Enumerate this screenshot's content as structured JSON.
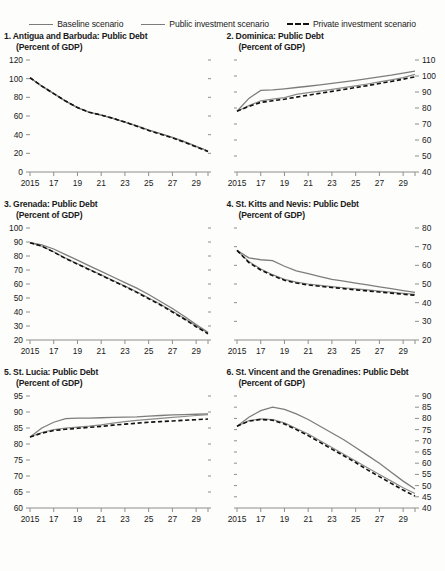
{
  "legend": {
    "items": [
      {
        "label": "Baseline scenario",
        "style": "solid",
        "color": "#7d7d7d"
      },
      {
        "label": "Public investment scenario",
        "style": "solid",
        "color": "#8a8a8a"
      },
      {
        "label": "Private investment scenario",
        "style": "dashed",
        "color": "#111111"
      }
    ]
  },
  "chart_data": [
    {
      "type": "line",
      "title": "1. Antigua and Barbuda: Public Debt",
      "subtitle": "(Percent of GDP)",
      "index": "1",
      "xlabel": "",
      "ylabel": "",
      "ylim": [
        0,
        120
      ],
      "yticks": [
        0,
        20,
        40,
        60,
        80,
        100,
        120
      ],
      "axis_side": "left",
      "x": [
        2015,
        2016,
        2017,
        2018,
        2019,
        2020,
        2021,
        2022,
        2023,
        2024,
        2025,
        2026,
        2027,
        2028,
        2029,
        2030
      ],
      "xticklabels": [
        "2015",
        "17",
        "19",
        "21",
        "23",
        "25",
        "27",
        "29"
      ],
      "series": [
        {
          "name": "Baseline scenario",
          "values": [
            101,
            92,
            84,
            76,
            69,
            64,
            61,
            57.5,
            53.5,
            49.5,
            45,
            41,
            37,
            32.5,
            27.5,
            22.5
          ]
        },
        {
          "name": "Public investment scenario",
          "values": [
            101,
            92,
            84,
            76,
            69,
            64,
            61,
            57.5,
            53.5,
            49.5,
            45,
            41,
            37,
            32.5,
            27.5,
            22.5
          ]
        },
        {
          "name": "Private investment scenario",
          "values": [
            101,
            92,
            84,
            76,
            69,
            64,
            61,
            57.5,
            53.5,
            49,
            44.5,
            40.5,
            36.5,
            32,
            27,
            22
          ]
        }
      ]
    },
    {
      "type": "line",
      "title": "2. Dominica: Public Debt",
      "subtitle": "(Percent of GDP)",
      "index": "2",
      "xlabel": "",
      "ylabel": "",
      "ylim": [
        40,
        110
      ],
      "yticks": [
        40,
        50,
        60,
        70,
        80,
        90,
        100,
        110
      ],
      "axis_side": "right",
      "x": [
        2015,
        2016,
        2017,
        2018,
        2019,
        2020,
        2021,
        2022,
        2023,
        2024,
        2025,
        2026,
        2027,
        2028,
        2029,
        2030
      ],
      "xticklabels": [
        "2015",
        "17",
        "19",
        "21",
        "23",
        "25",
        "27",
        "29"
      ],
      "series": [
        {
          "name": "Baseline scenario",
          "values": [
            78,
            86,
            91,
            91.3,
            92,
            92.8,
            93.6,
            94.5,
            95.4,
            96.3,
            97.3,
            98.3,
            99.4,
            100.5,
            101.8,
            103
          ]
        },
        {
          "name": "Public investment scenario",
          "values": [
            78,
            81.5,
            84.5,
            85.5,
            86.5,
            88.5,
            89.6,
            90.6,
            91.6,
            92.7,
            93.8,
            95,
            96.3,
            97.6,
            99,
            101
          ]
        },
        {
          "name": "Private investment scenario",
          "values": [
            78,
            81,
            83.5,
            84.5,
            85.5,
            86.8,
            88,
            89.2,
            90.4,
            91.6,
            92.8,
            94,
            95.3,
            96.6,
            98,
            99.5
          ]
        }
      ]
    },
    {
      "type": "line",
      "title": "3. Grenada: Public Debt",
      "subtitle": "(Percent of GDP)",
      "index": "3",
      "xlabel": "",
      "ylabel": "",
      "ylim": [
        20,
        100
      ],
      "yticks": [
        20,
        30,
        40,
        50,
        60,
        70,
        80,
        90,
        100
      ],
      "axis_side": "left",
      "x": [
        2015,
        2016,
        2017,
        2018,
        2019,
        2020,
        2021,
        2022,
        2023,
        2024,
        2025,
        2026,
        2027,
        2028,
        2029,
        2030
      ],
      "xticklabels": [
        "2015",
        "17",
        "19",
        "21",
        "23",
        "25",
        "27",
        "29"
      ],
      "series": [
        {
          "name": "Baseline scenario",
          "values": [
            89.5,
            88,
            85,
            81,
            77,
            73,
            69,
            65,
            61,
            57,
            52.5,
            47.5,
            42.5,
            37,
            31,
            25.5
          ]
        },
        {
          "name": "Public investment scenario",
          "values": [
            89.5,
            87,
            83,
            78.5,
            74.5,
            70.5,
            66.5,
            62.5,
            58.5,
            54.5,
            50,
            45.5,
            40.5,
            35.5,
            30,
            25
          ]
        },
        {
          "name": "Private investment scenario",
          "values": [
            89.5,
            87,
            82.8,
            78.2,
            74.2,
            70.2,
            66.2,
            62.2,
            58.2,
            54,
            49.5,
            45,
            40,
            35,
            29.5,
            24.5
          ]
        }
      ]
    },
    {
      "type": "line",
      "title": "4. St. Kitts and Nevis: Public Debt",
      "subtitle": "(Percent of GDP)",
      "index": "4",
      "xlabel": "",
      "ylabel": "",
      "ylim": [
        20,
        80
      ],
      "yticks": [
        20,
        30,
        40,
        50,
        60,
        70,
        80
      ],
      "axis_side": "right",
      "x": [
        2015,
        2016,
        2017,
        2018,
        2019,
        2020,
        2021,
        2022,
        2023,
        2024,
        2025,
        2026,
        2027,
        2028,
        2029,
        2030
      ],
      "xticklabels": [
        "2015",
        "17",
        "19",
        "21",
        "23",
        "25",
        "27",
        "29"
      ],
      "series": [
        {
          "name": "Baseline scenario",
          "values": [
            68,
            64,
            63,
            62.5,
            59.5,
            57,
            55.5,
            54,
            52.5,
            51.5,
            50.5,
            49.5,
            48.5,
            47.5,
            46.5,
            45.5
          ]
        },
        {
          "name": "Public investment scenario",
          "values": [
            68,
            62,
            58,
            55,
            52.5,
            51,
            50,
            49.3,
            48.6,
            48,
            47.4,
            46.8,
            46.2,
            45.6,
            45,
            44.5
          ]
        },
        {
          "name": "Private investment scenario",
          "values": [
            68,
            61.5,
            57.5,
            54.5,
            52,
            50.5,
            49.5,
            48.8,
            48.1,
            47.5,
            46.9,
            46.3,
            45.7,
            45.1,
            44.5,
            44
          ]
        }
      ]
    },
    {
      "type": "line",
      "title": "5. St. Lucia: Public Debt",
      "subtitle": "(Percent of GDP)",
      "index": "5",
      "xlabel": "",
      "ylabel": "",
      "ylim": [
        60,
        95
      ],
      "yticks": [
        60,
        65,
        70,
        75,
        80,
        85,
        90,
        95
      ],
      "axis_side": "left",
      "x": [
        2015,
        2016,
        2017,
        2018,
        2019,
        2020,
        2021,
        2022,
        2023,
        2024,
        2025,
        2026,
        2027,
        2028,
        2029,
        2030
      ],
      "xticklabels": [
        "2015",
        "17",
        "19",
        "21",
        "23",
        "25",
        "27",
        "29"
      ],
      "series": [
        {
          "name": "Baseline scenario",
          "values": [
            82.2,
            85,
            86.8,
            87.9,
            88.1,
            88.1,
            88.2,
            88.3,
            88.4,
            88.5,
            88.7,
            88.9,
            89.1,
            89.2,
            89.3,
            89.4
          ]
        },
        {
          "name": "Public investment scenario",
          "values": [
            82.2,
            83.6,
            84.5,
            85,
            85.3,
            85.6,
            86,
            86.5,
            87,
            87.4,
            87.7,
            88,
            88.3,
            88.6,
            88.9,
            89.2
          ]
        },
        {
          "name": "Private investment scenario",
          "values": [
            82.2,
            83.4,
            84.2,
            84.6,
            84.9,
            85.2,
            85.5,
            85.9,
            86.2,
            86.5,
            86.8,
            87,
            87.2,
            87.4,
            87.6,
            87.8
          ]
        }
      ]
    },
    {
      "type": "line",
      "title": "6. St. Vincent and the Grenadines: Public Debt",
      "subtitle": "(Percent of GDP)",
      "index": "6",
      "xlabel": "",
      "ylabel": "",
      "ylim": [
        40,
        90
      ],
      "yticks": [
        40,
        45,
        50,
        55,
        60,
        65,
        70,
        75,
        80,
        85,
        90
      ],
      "axis_side": "right",
      "x": [
        2015,
        2016,
        2017,
        2018,
        2019,
        2020,
        2021,
        2022,
        2023,
        2024,
        2025,
        2026,
        2027,
        2028,
        2029,
        2030
      ],
      "xticklabels": [
        "2015",
        "17",
        "19",
        "21",
        "23",
        "25",
        "27",
        "29"
      ],
      "series": [
        {
          "name": "Baseline scenario",
          "values": [
            76.5,
            80.5,
            83.5,
            85,
            84,
            82,
            79.5,
            76.5,
            73.5,
            70.5,
            67,
            63.5,
            60,
            56,
            52,
            48.5
          ]
        },
        {
          "name": "Public investment scenario",
          "values": [
            76.5,
            79,
            79.8,
            79.5,
            78,
            75.5,
            73,
            70,
            67,
            64,
            61,
            58,
            55,
            52,
            49,
            46.5
          ]
        },
        {
          "name": "Private investment scenario",
          "values": [
            76.5,
            78.8,
            79.5,
            79.2,
            77.5,
            75,
            72.3,
            69.3,
            66.3,
            63.3,
            60.3,
            57,
            54,
            51,
            48,
            45.3
          ]
        }
      ]
    }
  ]
}
